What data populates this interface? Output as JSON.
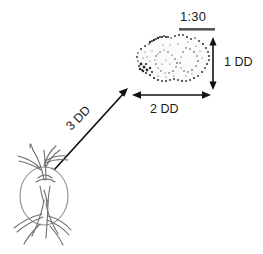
{
  "figure": {
    "title_label": "1:30",
    "background_color": "#ffffff",
    "ink_color": "#1a1a1a",
    "vessel_color": "#7a7a7a"
  },
  "measurements": {
    "clock_position": "1:30",
    "lesion_height": "1 DD",
    "lesion_width": "2 DD",
    "distance_from_disc": "3 DD"
  },
  "structures": {
    "lesion_name": "retinal-lesion",
    "disc_name": "optic-disc"
  }
}
